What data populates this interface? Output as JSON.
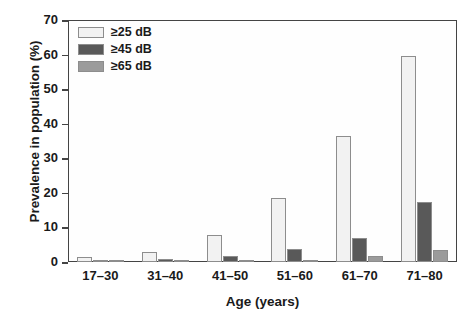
{
  "chart_data": {
    "type": "bar",
    "title": "",
    "xlabel": "Age (years)",
    "ylabel": "Prevalence in population (%)",
    "categories": [
      "17–30",
      "31–40",
      "41–50",
      "51–60",
      "61–70",
      "71–80"
    ],
    "series": [
      {
        "name": "≥25 dB",
        "color": "#f2f2f2",
        "values": [
          1.5,
          2.8,
          7.8,
          18.5,
          36.5,
          59.5
        ]
      },
      {
        "name": "≥45 dB",
        "color": "#595959",
        "values": [
          0.4,
          0.8,
          1.8,
          3.8,
          7.0,
          17.5
        ]
      },
      {
        "name": "≥65 dB",
        "color": "#9b9b9b",
        "values": [
          0.2,
          0.3,
          0.4,
          0.7,
          1.8,
          3.5
        ]
      }
    ],
    "ylim": [
      0,
      70
    ],
    "yticks": [
      0,
      10,
      20,
      30,
      40,
      50,
      60,
      70
    ],
    "ytick_labels": [
      "0",
      "10",
      "20",
      "30",
      "40",
      "50",
      "60",
      "70"
    ],
    "grid": false,
    "legend_position": "top-left",
    "legend_entries": [
      "≥25 dB",
      "≥45 dB",
      "≥65 dB"
    ],
    "frame_color": "#444444",
    "text_color": "#1a1a1a",
    "background": "#ffffff"
  }
}
